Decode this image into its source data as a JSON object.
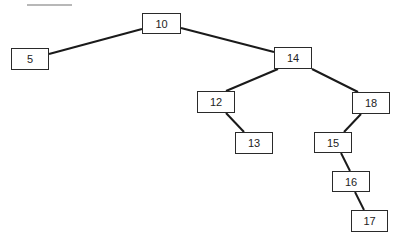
{
  "diagram": {
    "type": "binary-search-tree",
    "header_rule": {
      "x": 27,
      "y": 4,
      "w": 45
    },
    "nodes": [
      {
        "id": "n10",
        "label": "10",
        "x": 142,
        "y": 13,
        "w": 39,
        "h": 21
      },
      {
        "id": "n5",
        "label": "5",
        "x": 11,
        "y": 48,
        "w": 38,
        "h": 22
      },
      {
        "id": "n14",
        "label": "14",
        "x": 274,
        "y": 47,
        "w": 38,
        "h": 22
      },
      {
        "id": "n12",
        "label": "12",
        "x": 197,
        "y": 91,
        "w": 38,
        "h": 22
      },
      {
        "id": "n18",
        "label": "18",
        "x": 352,
        "y": 92,
        "w": 38,
        "h": 22
      },
      {
        "id": "n13",
        "label": "13",
        "x": 235,
        "y": 132,
        "w": 38,
        "h": 22
      },
      {
        "id": "n15",
        "label": "15",
        "x": 314,
        "y": 132,
        "w": 38,
        "h": 21
      },
      {
        "id": "n16",
        "label": "16",
        "x": 332,
        "y": 171,
        "w": 38,
        "h": 21
      },
      {
        "id": "n17",
        "label": "17",
        "x": 351,
        "y": 210,
        "w": 37,
        "h": 22
      }
    ],
    "edges": [
      {
        "from": "10",
        "to": "5",
        "x1": 142,
        "y1": 29,
        "x2": 49,
        "y2": 54
      },
      {
        "from": "10",
        "to": "14",
        "x1": 181,
        "y1": 28,
        "x2": 274,
        "y2": 52
      },
      {
        "from": "14",
        "to": "12",
        "x1": 278,
        "y1": 69,
        "x2": 226,
        "y2": 91
      },
      {
        "from": "14",
        "to": "18",
        "x1": 312,
        "y1": 69,
        "x2": 358,
        "y2": 92
      },
      {
        "from": "12",
        "to": "13",
        "x1": 226,
        "y1": 113,
        "x2": 244,
        "y2": 132
      },
      {
        "from": "18",
        "to": "15",
        "x1": 361,
        "y1": 114,
        "x2": 344,
        "y2": 132
      },
      {
        "from": "15",
        "to": "16",
        "x1": 341,
        "y1": 153,
        "x2": 350,
        "y2": 171
      },
      {
        "from": "16",
        "to": "17",
        "x1": 355,
        "y1": 192,
        "x2": 364,
        "y2": 210
      }
    ]
  }
}
